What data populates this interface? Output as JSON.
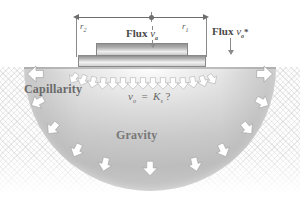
{
  "figure": {
    "type": "scientific-diagram",
    "background_color": "#ffffff",
    "bulb_color": "#c9c9c9",
    "arrow_color": "#ffffff",
    "text_color": "#5a5a5a"
  },
  "dimensions": {
    "radius_outer_label": "r",
    "radius_outer_sub": "2",
    "radius_inner_label": "r",
    "radius_inner_sub": "1"
  },
  "labels": {
    "flux_disc": "Flux",
    "flux_disc_symbol": "v",
    "flux_disc_sub": "a",
    "flux_outer": "Flux",
    "flux_outer_symbol": "v",
    "flux_outer_sub": "o",
    "flux_outer_star": "*",
    "capillarity": "Capillarity",
    "gravity": "Gravity"
  },
  "equation": {
    "lhs_symbol": "v",
    "lhs_sub": "o",
    "operator": "=",
    "rhs_symbol": "K",
    "rhs_sub": "s",
    "unknown": "?",
    "full_text": "v o = K s ?"
  },
  "arrows": {
    "capillarity_direction": "lateral-outward",
    "gravity_direction": "downward",
    "infiltration_direction": "downward-radial"
  }
}
